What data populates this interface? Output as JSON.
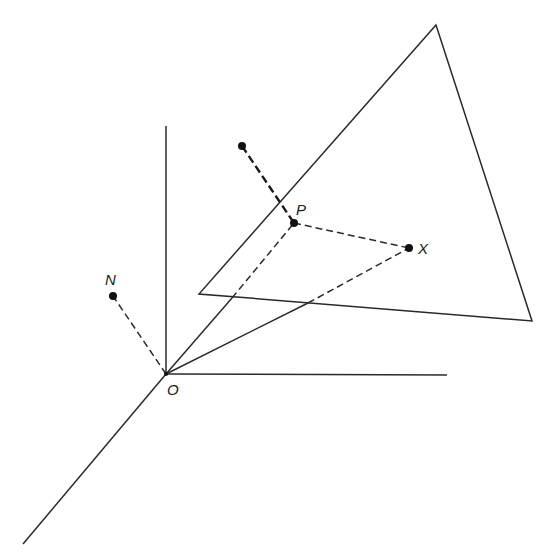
{
  "diagram": {
    "colors": {
      "ink": "#2a2a2a",
      "background": "#ffffff"
    },
    "labels": {
      "origin": "O",
      "normal": "N",
      "projection": "P",
      "point": "X"
    },
    "points": {
      "O": [
        166,
        374
      ],
      "N": [
        113,
        296
      ],
      "P": [
        294,
        223
      ],
      "X": [
        409,
        248
      ],
      "normal_tip": [
        242,
        146
      ]
    },
    "axes": {
      "vertical_top": [
        166,
        126
      ],
      "horizontal_end": [
        447,
        375
      ],
      "diagonal_end": [
        23,
        544
      ]
    },
    "plane_triangle": [
      [
        436,
        25
      ],
      [
        532,
        321
      ],
      [
        199,
        294
      ]
    ]
  }
}
